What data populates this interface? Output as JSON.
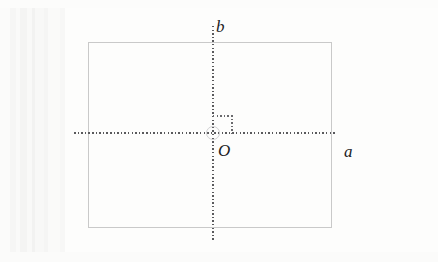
{
  "figure": {
    "kind": "coordinate-axes-diagram",
    "labels": {
      "vertical_axis": "b",
      "horizontal_axis": "a",
      "origin": "O"
    },
    "colors": {
      "background": "#fdfdfc",
      "frame_stroke": "#c9c9c9",
      "axis_dot": "#59595c",
      "angle_mark_dot": "#6a6a6d",
      "origin_marker": "#d0d0d2",
      "label_text": "#1c1c1e"
    },
    "elements": {
      "frame_rectangle": "bounding-rectangle",
      "horizontal_axis": "dotted-horizontal-axis",
      "vertical_axis": "dotted-vertical-axis",
      "right_angle_mark": "dotted-right-angle-square",
      "origin_marker": "origin-circle-marker"
    }
  }
}
